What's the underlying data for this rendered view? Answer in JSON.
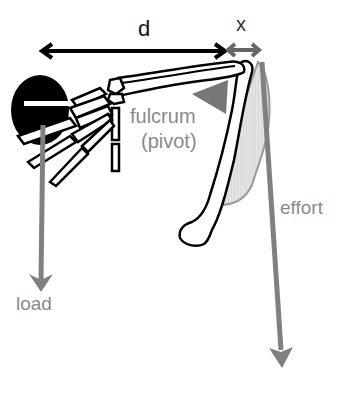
{
  "diagram": {
    "type": "lever-arm",
    "labels": {
      "d": "d",
      "x": "x",
      "fulcrum": "fulcrum",
      "pivot": "(pivot)",
      "effort": "effort",
      "load": "load"
    },
    "colors": {
      "bone_outline": "#000000",
      "ball": "#000000",
      "force_arrow": "#808080",
      "fulcrum_triangle": "#777777",
      "muscle_fill": "#d9d9d9",
      "muscle_outline": "#999999",
      "x_arrow": "#666666",
      "label_gray": "#8a8a8a"
    }
  }
}
